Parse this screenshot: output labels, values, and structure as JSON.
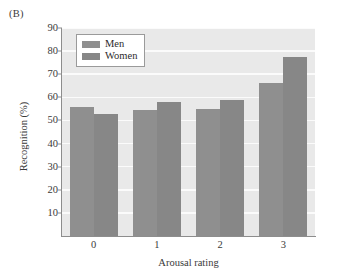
{
  "figure": {
    "panel_label": "(B)",
    "background_color": "#ffffff",
    "plot_background_color": "#e9e9e9",
    "gridline_color": "#fbfbfb",
    "axis_color": "#8d8d8d"
  },
  "legend": {
    "position": "top-left-inside",
    "entries": [
      {
        "label": "Men",
        "color": "#8f8f8f"
      },
      {
        "label": "Women",
        "color": "#878787"
      }
    ]
  },
  "chart_data": {
    "type": "bar",
    "title": "(B)",
    "xlabel": "Arousal rating",
    "ylabel": "Recognition (%)",
    "categories": [
      "0",
      "1",
      "2",
      "3"
    ],
    "series": [
      {
        "name": "Men",
        "color": "#8f8f8f",
        "values": [
          56,
          54.5,
          55,
          66
        ]
      },
      {
        "name": "Women",
        "color": "#878787",
        "values": [
          53,
          57.8,
          58.7,
          77.5
        ]
      }
    ],
    "ylim": [
      0,
      90
    ],
    "yticks": [
      10,
      20,
      30,
      40,
      50,
      60,
      70,
      80,
      90
    ],
    "ytick_labels": [
      "10",
      "20",
      "30",
      "40",
      "50",
      "60",
      "70",
      "80",
      "90"
    ],
    "xtick_labels": [
      "0",
      "1",
      "2",
      "3"
    ],
    "grid": "horizontal",
    "legend_position": "upper left"
  }
}
